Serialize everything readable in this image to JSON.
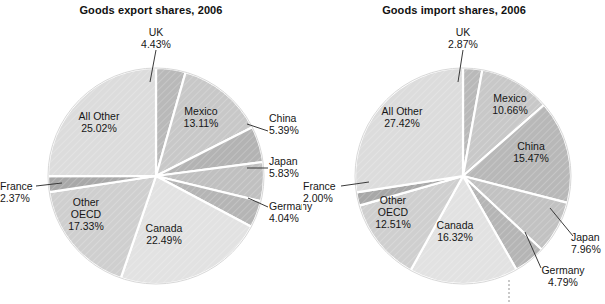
{
  "figure": {
    "background": "#ffffff",
    "text_color": "#161616"
  },
  "charts": [
    {
      "id": "goods-export-shares",
      "title": "Goods export shares, 2006",
      "center": {
        "x": 156,
        "y": 176
      },
      "radius": 108,
      "slices": [
        {
          "label": "UK",
          "value": "4.43%",
          "color": "#b9b9b9"
        },
        {
          "label": "Mexico",
          "value": "13.11%",
          "color": "#c8c8c8"
        },
        {
          "label": "China",
          "value": "5.39%",
          "color": "#b3b3b3"
        },
        {
          "label": "Japan",
          "value": "5.83%",
          "color": "#c0c0c0"
        },
        {
          "label": "Germany",
          "value": "4.04%",
          "color": "#b5b5b5"
        },
        {
          "label": "Canada",
          "value": "22.49%",
          "color": "#e2e2e2"
        },
        {
          "label": "Other OECD",
          "value": "17.33%",
          "color": "#cfcfcf"
        },
        {
          "label": "France",
          "value": "2.37%",
          "color": "#a8a8a8"
        },
        {
          "label": "All Other",
          "value": "25.02%",
          "color": "#dcdcdc"
        }
      ]
    },
    {
      "id": "goods-import-shares",
      "title": "Goods import shares, 2006",
      "center": {
        "x": 160,
        "y": 176
      },
      "radius": 108,
      "slices": [
        {
          "label": "UK",
          "value": "2.87%",
          "color": "#b9b9b9"
        },
        {
          "label": "Mexico",
          "value": "10.66%",
          "color": "#c8c8c8"
        },
        {
          "label": "China",
          "value": "15.47%",
          "color": "#b8b8b8"
        },
        {
          "label": "Japan",
          "value": "7.96%",
          "color": "#c2c2c2"
        },
        {
          "label": "Germany",
          "value": "4.79%",
          "color": "#b5b5b5"
        },
        {
          "label": "Canada",
          "value": "16.32%",
          "color": "#e2e2e2"
        },
        {
          "label": "Other OECD",
          "value": "12.51%",
          "color": "#cfcfcf"
        },
        {
          "label": "France",
          "value": "2.00%",
          "color": "#a8a8a8"
        },
        {
          "label": "All Other",
          "value": "27.42%",
          "color": "#dcdcdc"
        }
      ]
    }
  ],
  "chart_data": [
    {
      "type": "pie",
      "title": "Goods export shares, 2006",
      "categories": [
        "UK",
        "Mexico",
        "China",
        "Japan",
        "Germany",
        "Canada",
        "Other OECD",
        "France",
        "All Other"
      ],
      "values": [
        4.43,
        13.11,
        5.39,
        5.83,
        4.04,
        22.49,
        17.33,
        2.37,
        25.02
      ],
      "unit": "percent",
      "labels": [
        "4.43%",
        "13.11%",
        "5.39%",
        "5.83%",
        "4.04%",
        "22.49%",
        "17.33%",
        "2.37%",
        "25.02%"
      ],
      "start_angle_deg": 0,
      "direction": "clockwise",
      "legend": "none",
      "grid": false,
      "xlabel": "",
      "ylabel": ""
    },
    {
      "type": "pie",
      "title": "Goods import shares, 2006",
      "categories": [
        "UK",
        "Mexico",
        "China",
        "Japan",
        "Germany",
        "Canada",
        "Other OECD",
        "France",
        "All Other"
      ],
      "values": [
        2.87,
        10.66,
        15.47,
        7.96,
        4.79,
        16.32,
        12.51,
        2.0,
        27.42
      ],
      "unit": "percent",
      "labels": [
        "2.87%",
        "10.66%",
        "15.47%",
        "7.96%",
        "4.79%",
        "16.32%",
        "12.51%",
        "2.00%",
        "27.42%"
      ],
      "start_angle_deg": 0,
      "direction": "clockwise",
      "legend": "none",
      "grid": false,
      "xlabel": "",
      "ylabel": ""
    }
  ],
  "left_labels": {
    "uk": {
      "name": "UK",
      "value": "4.43%"
    },
    "mexico": {
      "name": "Mexico",
      "value": "13.11%"
    },
    "china": {
      "name": "China",
      "value": "5.39%"
    },
    "japan": {
      "name": "Japan",
      "value": "5.83%"
    },
    "germany": {
      "name": "Germany",
      "value": "4.04%"
    },
    "canada": {
      "name": "Canada",
      "value": "22.49%"
    },
    "otheroecd": {
      "name1": "Other",
      "name2": "OECD",
      "value": "17.33%"
    },
    "france": {
      "name": "France",
      "value": "2.37%"
    },
    "allother": {
      "name": "All Other",
      "value": "25.02%"
    }
  },
  "right_labels": {
    "uk": {
      "name": "UK",
      "value": "2.87%"
    },
    "mexico": {
      "name": "Mexico",
      "value": "10.66%"
    },
    "china": {
      "name": "China",
      "value": "15.47%"
    },
    "japan": {
      "name": "Japan",
      "value": "7.96%"
    },
    "germany": {
      "name": "Germany",
      "value": "4.79%"
    },
    "canada": {
      "name": "Canada",
      "value": "16.32%"
    },
    "otheroecd": {
      "name1": "Other",
      "name2": "OECD",
      "value": "12.51%"
    },
    "france": {
      "name": "France",
      "value": "2.00%"
    },
    "allother": {
      "name": "All Other",
      "value": "27.42%"
    }
  }
}
